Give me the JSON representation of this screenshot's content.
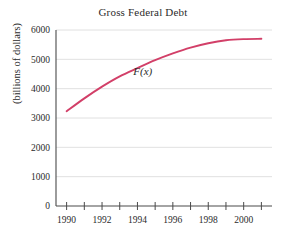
{
  "chart_data": {
    "type": "line",
    "title": "Gross Federal Debt",
    "xlabel": "",
    "ylabel": "(billions of dollars)",
    "xlim": [
      1989.4,
      2001.6
    ],
    "ylim": [
      0,
      6000
    ],
    "grid": true,
    "legend": "none",
    "annotations": [
      {
        "text": "F(x)",
        "x": 1994.3,
        "y": 4450
      }
    ],
    "yticks": [
      0,
      1000,
      2000,
      3000,
      4000,
      5000,
      6000
    ],
    "ytick_labels": [
      "0",
      "1000",
      "2000",
      "3000",
      "4000",
      "5000",
      "6000"
    ],
    "xticks": [
      1990,
      1991,
      1992,
      1993,
      1994,
      1995,
      1996,
      1997,
      1998,
      1999,
      2000,
      2001
    ],
    "xtick_labels_shown": [
      "1990",
      "1992",
      "1994",
      "1996",
      "1998",
      "2000"
    ],
    "xtick_labels_values": [
      1990,
      1992,
      1994,
      1996,
      1998,
      2000
    ],
    "series": [
      {
        "name": "F(x)",
        "color": "#d23f68",
        "x": [
          1990,
          1991,
          1992,
          1993,
          1994,
          1995,
          1996,
          1997,
          1998,
          1999,
          2000,
          2001
        ],
        "values": [
          3230,
          3670,
          4070,
          4420,
          4700,
          4970,
          5200,
          5400,
          5550,
          5650,
          5690,
          5700
        ]
      }
    ]
  },
  "figure": {
    "title": "Gross Federal Debt",
    "ylabel": "(billions of dollars)",
    "curve_label": "F(x)"
  }
}
